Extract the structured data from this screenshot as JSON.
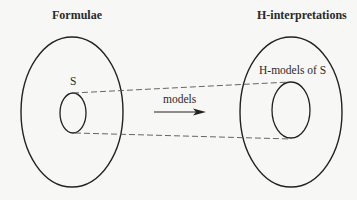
{
  "diagram": {
    "left_set": {
      "title": "Formulae",
      "subset_label": "S"
    },
    "right_set": {
      "title": "H-interpretations",
      "subset_label": "H-models of S"
    },
    "mapping": {
      "label": "models",
      "direction": "left-to-right"
    },
    "colors": {
      "stroke": "#222222",
      "dashed": "#555555",
      "background": "#f7f7f5"
    }
  }
}
